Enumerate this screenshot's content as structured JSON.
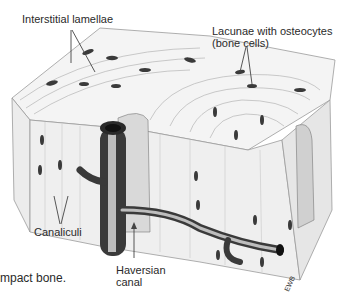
{
  "labels": {
    "interstitial": "Interstitial lamellae",
    "lacunae_line1": "Lacunae with osteocytes",
    "lacunae_line2": "(bone cells)",
    "canaliculi": "Canaliculi",
    "haversian_line1": "Haversian",
    "haversian_line2": "canal",
    "caption_fragment": "mpact bone.",
    "signature": "EWB"
  },
  "colors": {
    "background": "#ffffff",
    "ink": "#2a2a2a",
    "line": "#555555",
    "vessel_dark": "#333333",
    "vessel_light": "#cfcfcf"
  }
}
